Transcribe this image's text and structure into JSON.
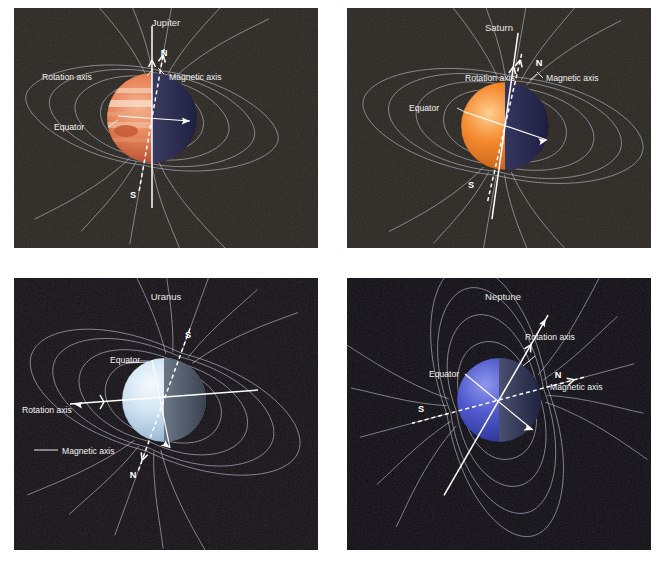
{
  "figure": {
    "background": "#ffffff",
    "panel_bg_jupiter": "#2b2620",
    "panel_bg_saturn": "#2a2620",
    "panel_bg_uranus": "#120d14",
    "panel_bg_neptune": "#0a0710",
    "field_line_color": "#b9bcd0",
    "label_color": "#f2f2f2"
  },
  "panels": [
    {
      "id": "jupiter",
      "title": "Jupiter",
      "labels": {
        "rotation_axis": "Rotation axis",
        "magnetic_axis": "Magnetic axis",
        "equator": "Equator",
        "north": "N",
        "south": "S"
      },
      "planet": {
        "lit_color": "#e0724a",
        "lit_color2": "#f0a886",
        "shadow_color": "#2a2b4a",
        "band_color": "#f5d8c0",
        "spot_color": "#c05a3a",
        "has_bands": true,
        "has_red_spot": true
      },
      "axes": {
        "rotation_tilt_deg": 0,
        "magnetic_tilt_deg": 10
      }
    },
    {
      "id": "saturn",
      "title": "Saturn",
      "labels": {
        "rotation_axis": "Rotation axis",
        "magnetic_axis": "Magnetic axis",
        "equator": "Equator",
        "north": "N",
        "south": "S"
      },
      "planet": {
        "lit_color": "#f07a28",
        "lit_color2": "#f9b36a",
        "shadow_color": "#27284a",
        "band_color": "#fbd9a8",
        "spot_color": "#d8722e",
        "has_bands": false,
        "has_red_spot": false
      },
      "axes": {
        "rotation_tilt_deg": 8,
        "magnetic_tilt_deg": 12
      }
    },
    {
      "id": "uranus",
      "title": "Uranus",
      "labels": {
        "rotation_axis": "Rotation axis",
        "magnetic_axis": "Magnetic axis",
        "equator": "Equator",
        "north": "N",
        "south": "S"
      },
      "planet": {
        "lit_color": "#cfe0f0",
        "lit_color2": "#eef5fc",
        "shadow_color": "#3b4350",
        "band_color": "#dbe8f5",
        "spot_color": "#b8cddf",
        "has_bands": false,
        "has_red_spot": false
      },
      "axes": {
        "rotation_tilt_deg": 82,
        "magnetic_tilt_deg": 20
      }
    },
    {
      "id": "neptune",
      "title": "Neptune",
      "labels": {
        "rotation_axis": "Rotation axis",
        "magnetic_axis": "Magnetic axis",
        "equator": "Equator",
        "north": "N",
        "south": "S"
      },
      "planet": {
        "lit_color": "#4a53c8",
        "lit_color2": "#7b84e0",
        "shadow_color": "#1c1f38",
        "band_color": "#6a74d8",
        "spot_color": "#3a42a8",
        "has_bands": false,
        "has_red_spot": false
      },
      "axes": {
        "rotation_tilt_deg": 30,
        "magnetic_tilt_deg": 75
      }
    }
  ]
}
